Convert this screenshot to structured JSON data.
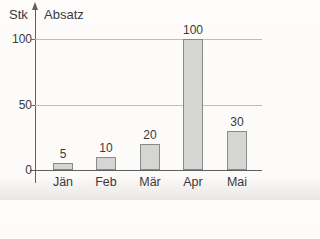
{
  "chart_data": {
    "type": "bar",
    "title": "",
    "y_unit_label": "Stk",
    "y_axis_title": "Absatz",
    "categories": [
      "Jän",
      "Feb",
      "Mär",
      "Apr",
      "Mai"
    ],
    "values": [
      5,
      10,
      20,
      100,
      30
    ],
    "value_labels": [
      "5",
      "10",
      "20",
      "100",
      "30"
    ],
    "ylim": [
      0,
      110
    ],
    "yticks": [
      0,
      50,
      100
    ],
    "gridlines": [
      50,
      100
    ],
    "grid": "horizontal-only",
    "legend": "none",
    "colors": {
      "bar_fill": "#d5d5d4",
      "bar_border": "#8a8a8a",
      "axis": "#5f5f5f",
      "gridline": "#bdbdbd",
      "text": "#3a3a3a",
      "background": "#fcfbfa"
    }
  }
}
